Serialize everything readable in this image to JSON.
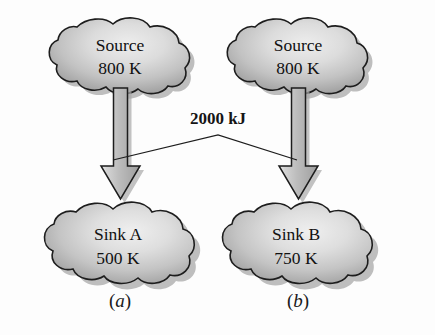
{
  "figure": {
    "kind": "thermodynamics-heat-transfer-diagram",
    "background_color": "#fdfdfd",
    "energy_label": "2000 kJ",
    "panels": [
      {
        "id": "a",
        "caption": "(a)",
        "caption_letter": "a",
        "source": {
          "name": "Source",
          "temperature": "800 K",
          "reservoir_type": "source"
        },
        "sink": {
          "name_prefix": "Sink",
          "name_symbol": "A",
          "temperature": "500 K",
          "reservoir_type": "sink"
        }
      },
      {
        "id": "b",
        "caption": "(b)",
        "caption_letter": "b",
        "source": {
          "name": "Source",
          "temperature": "800 K",
          "reservoir_type": "source"
        },
        "sink": {
          "name_prefix": "Sink",
          "name_symbol": "B",
          "temperature": "750 K",
          "reservoir_type": "sink"
        }
      }
    ],
    "colors": {
      "outline": "#1d1d1d",
      "cloud_light": "#e9e9e9",
      "cloud_mid": "#c3c3c3",
      "cloud_dark": "#8f8f8f",
      "arrow_light": "#e2e2e2",
      "arrow_mid": "#b9b9b9",
      "arrow_dark": "#9a9a9a",
      "shadow": "#9b9b9b",
      "text": "#111111"
    }
  }
}
